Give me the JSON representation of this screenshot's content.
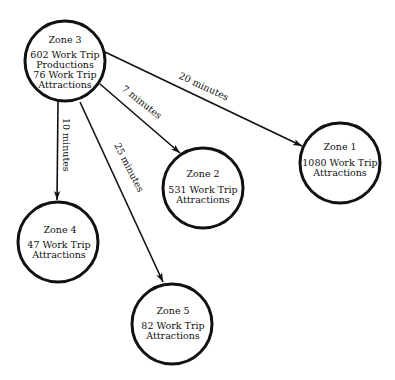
{
  "diagram": {
    "nodes": [
      {
        "id": "zone3",
        "title": "Zone 3",
        "lines": [
          "602 Work Trip",
          "Productions",
          "76 Work Trip",
          "Attractions"
        ]
      },
      {
        "id": "zone1",
        "title": "Zone 1",
        "lines": [
          "1080 Work Trip",
          "Attractions"
        ]
      },
      {
        "id": "zone2",
        "title": "Zone 2",
        "lines": [
          "531 Work Trip",
          "Attractions"
        ]
      },
      {
        "id": "zone4",
        "title": "Zone 4",
        "lines": [
          "47 Work Trip",
          "Attractions"
        ]
      },
      {
        "id": "zone5",
        "title": "Zone 5",
        "lines": [
          "82 Work Trip",
          "Attractions"
        ]
      }
    ],
    "edges": [
      {
        "from": "zone3",
        "to": "zone1",
        "label": "20 minutes"
      },
      {
        "from": "zone3",
        "to": "zone2",
        "label": "7 minutes"
      },
      {
        "from": "zone3",
        "to": "zone4",
        "label": "10 minutes"
      },
      {
        "from": "zone3",
        "to": "zone5",
        "label": "25 minutes"
      }
    ]
  }
}
